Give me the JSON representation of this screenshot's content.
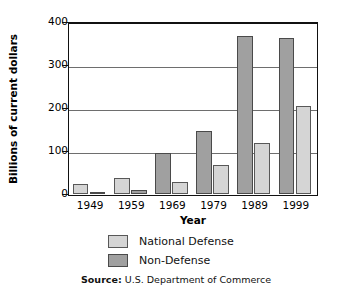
{
  "chart_data": {
    "type": "bar",
    "title": "",
    "xlabel": "Year",
    "ylabel": "Billions of current dollars",
    "categories": [
      "1949",
      "1959",
      "1969",
      "1979",
      "1989",
      "1999"
    ],
    "series": [
      {
        "name": "National Defense",
        "color": "#d5d5d5",
        "values": [
          23,
          38,
          28,
          68,
          120,
          205
        ]
      },
      {
        "name": "Non-Defense",
        "color": "#a0a0a0",
        "values": [
          5,
          10,
          95,
          148,
          368,
          362
        ]
      }
    ],
    "ylim": [
      0,
      400
    ],
    "yticks": [
      0,
      100,
      200,
      300,
      400
    ],
    "ytick_labels": [
      "0",
      "100",
      "200",
      "300",
      "400"
    ],
    "grid": "horizontal",
    "legend_position": "below-axes",
    "source_prefix": "Source:",
    "source_text": " U.S. Department of Commerce"
  },
  "axes": {
    "y_title": "Billions of current dollars",
    "x_title": "Year",
    "y_ticks": [
      {
        "label": "400",
        "value": 400
      },
      {
        "label": "300",
        "value": 300
      },
      {
        "label": "200",
        "value": 200
      },
      {
        "label": "100",
        "value": 100
      },
      {
        "label": "0",
        "value": 0
      }
    ],
    "x_ticks": [
      "1949",
      "1959",
      "1969",
      "1979",
      "1989",
      "1999"
    ]
  },
  "legend": {
    "items": [
      {
        "label": "National Defense",
        "swatch": "light-gray"
      },
      {
        "label": "Non-Defense",
        "swatch": "dark-gray"
      }
    ]
  },
  "footer": {
    "source_label": "Source:",
    "source_value": "U.S. Department of Commerce"
  }
}
